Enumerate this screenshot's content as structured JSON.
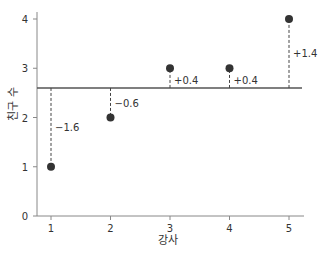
{
  "chart_data": {
    "type": "scatter",
    "title": "",
    "xlabel": "강사",
    "ylabel": "친구 수",
    "x": [
      1,
      2,
      3,
      4,
      5
    ],
    "values": [
      1,
      2,
      3,
      3,
      4
    ],
    "mean": 2.6,
    "deviations": [
      "−1.6",
      "−0.6",
      "+0.4",
      "+0.4",
      "+1.4"
    ],
    "xticks": [
      "1",
      "2",
      "3",
      "4",
      "5"
    ],
    "yticks": [
      "0",
      "1",
      "2",
      "3",
      "4"
    ],
    "xlim": [
      0.77,
      5.22
    ],
    "ylim": [
      0,
      4.2
    ],
    "grid": false,
    "colors": {
      "point": "#333333",
      "line": "#555555",
      "axis": "#777777"
    }
  }
}
